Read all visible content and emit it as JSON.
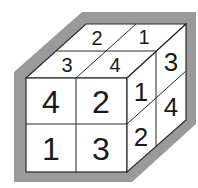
{
  "figure": {
    "type": "numbered-cube-puzzle",
    "colors": {
      "shadow": "#9a9a9a",
      "face": "#ffffff",
      "line": "#2a2a2a",
      "text": "#1a1a1a"
    },
    "top_face": {
      "back_left": "2",
      "back_right": "1",
      "front_left": "3",
      "front_right": "4"
    },
    "front_face": {
      "top_left": "4",
      "top_right": "2",
      "bottom_left": "1",
      "bottom_right": "3"
    },
    "right_face": {
      "top_front": "1",
      "top_back": "3",
      "bottom_front": "2",
      "bottom_back": "4"
    }
  }
}
